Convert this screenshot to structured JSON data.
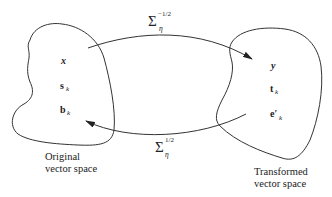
{
  "diagram": {
    "type": "mapping-diagram",
    "left_space": {
      "label_line1": "Original",
      "label_line2": "vector space",
      "vectors": [
        {
          "symbol": "x",
          "subscript": "",
          "style": "bold-italic"
        },
        {
          "symbol": "s",
          "subscript": "k",
          "style": "bold"
        },
        {
          "symbol": "b",
          "subscript": "k",
          "style": "bold"
        }
      ]
    },
    "right_space": {
      "label_line1": "Transformed",
      "label_line2": "vector space",
      "vectors": [
        {
          "symbol": "y",
          "subscript": "",
          "style": "bold-italic"
        },
        {
          "symbol": "t",
          "subscript": "k",
          "style": "bold"
        },
        {
          "symbol": "e′",
          "subscript": "k",
          "style": "bold"
        }
      ]
    },
    "arrows": [
      {
        "direction": "left-to-right",
        "operator": "Σ",
        "subscript": "η",
        "superscript": "−1/2"
      },
      {
        "direction": "right-to-left",
        "operator": "Σ",
        "subscript": "η",
        "superscript": "1/2"
      }
    ],
    "stroke_color": "#333333"
  }
}
